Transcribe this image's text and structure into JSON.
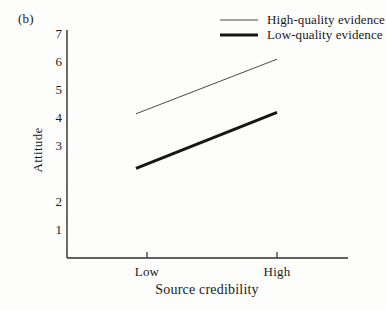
{
  "figure": {
    "panel_label": "(b)"
  },
  "legend": {
    "position": "top-right",
    "entries": [
      {
        "label": "High-quality evidence",
        "style": "thin",
        "color": "#4a4a4a"
      },
      {
        "label": "Low-quality evidence",
        "style": "thick",
        "color": "#161616"
      }
    ]
  },
  "axes": {
    "y_title": "Attitude",
    "x_title": "Source credibility",
    "y_ticks": [
      "7",
      "6",
      "5",
      "4",
      "3",
      "2",
      "1"
    ],
    "x_ticks": [
      "Low",
      "High"
    ]
  },
  "chart_data": {
    "type": "line",
    "title": "(b)",
    "xlabel": "Source credibility",
    "ylabel": "Attitude",
    "categories": [
      "Low",
      "High"
    ],
    "x": [
      0,
      1
    ],
    "ylim": [
      0.4,
      7.3
    ],
    "yticks": [
      1,
      2,
      3,
      4,
      5,
      6,
      7
    ],
    "grid": false,
    "legend_position": "top-right",
    "series": [
      {
        "name": "High-quality evidence",
        "values": [
          4.15,
          6.1
        ],
        "color": "#4a4a4a",
        "linewidth": 1
      },
      {
        "name": "Low-quality evidence",
        "values": [
          2.2,
          4.2
        ],
        "color": "#161616",
        "linewidth": 3
      }
    ]
  }
}
